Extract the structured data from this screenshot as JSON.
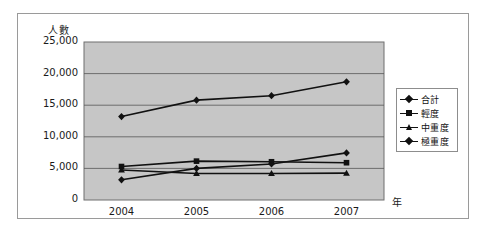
{
  "chart_data": {
    "type": "line",
    "title": "",
    "xlabel": "年",
    "ylabel": "人數",
    "categories": [
      "2004",
      "2005",
      "2006",
      "2007"
    ],
    "ylim": [
      0,
      25000
    ],
    "ytick_labels": [
      "25,000",
      "20,000",
      "15,000",
      "10,000",
      "5,000",
      "0"
    ],
    "ytick_values": [
      25000,
      20000,
      15000,
      10000,
      5000,
      0
    ],
    "grid": true,
    "legend_position": "right",
    "plot_background": "#c6c6c6",
    "line_color": "#111111",
    "series": [
      {
        "name": "合計",
        "marker": "diamond",
        "values": [
          13200,
          15800,
          16500,
          18700
        ]
      },
      {
        "name": "輕度",
        "marker": "square",
        "values": [
          5300,
          6150,
          6050,
          5900
        ]
      },
      {
        "name": "中重度",
        "marker": "triangle",
        "values": [
          4750,
          4200,
          4200,
          4250
        ]
      },
      {
        "name": "極重度",
        "marker": "diamond",
        "values": [
          3200,
          5000,
          5700,
          7450
        ]
      }
    ]
  },
  "legend": {
    "items": [
      {
        "label": "合計",
        "marker": "diamond"
      },
      {
        "label": "輕度",
        "marker": "square"
      },
      {
        "label": "中重度",
        "marker": "triangle"
      },
      {
        "label": "極重度",
        "marker": "diamond"
      }
    ]
  }
}
